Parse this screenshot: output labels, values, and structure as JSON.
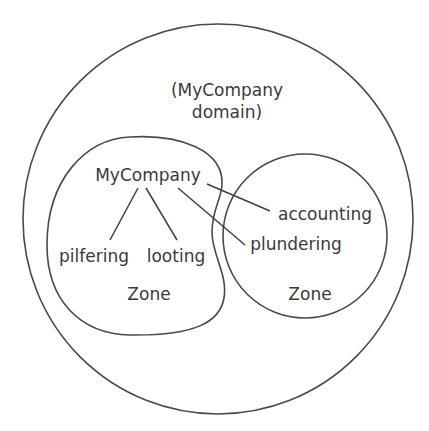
{
  "diagram": {
    "type": "domain-zone-diagram",
    "domain_label_line1": "(MyCompany",
    "domain_label_line2": "domain)",
    "nodes": {
      "root": "MyCompany",
      "pilfering": "pilfering",
      "looting": "looting",
      "accounting": "accounting",
      "plundering": "plundering"
    },
    "zones": {
      "left_zone_label": "Zone",
      "right_zone_label": "Zone"
    },
    "edges": [
      {
        "from": "MyCompany",
        "to": "pilfering"
      },
      {
        "from": "MyCompany",
        "to": "looting"
      },
      {
        "from": "MyCompany",
        "to": "accounting"
      },
      {
        "from": "MyCompany",
        "to": "plundering"
      }
    ],
    "colors": {
      "stroke": "#4a4a4a",
      "text": "#3a3a3a",
      "background": "#ffffff"
    }
  }
}
